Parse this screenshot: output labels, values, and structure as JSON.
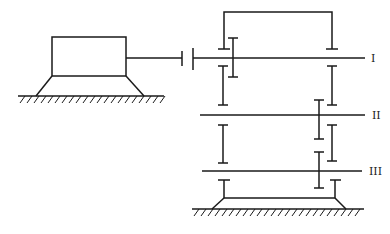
{
  "diagram": {
    "type": "gear transmission schematic",
    "shafts": [
      {
        "id": "shaft-1",
        "label": "I"
      },
      {
        "id": "shaft-2",
        "label": "II"
      },
      {
        "id": "shaft-3",
        "label": "III"
      }
    ],
    "components": [
      "motor",
      "coupling",
      "motor-base",
      "gearbox-base",
      "housing-bracket",
      "gears"
    ],
    "colors": {
      "line": "#1a1a1a",
      "background": "#ffffff"
    }
  }
}
